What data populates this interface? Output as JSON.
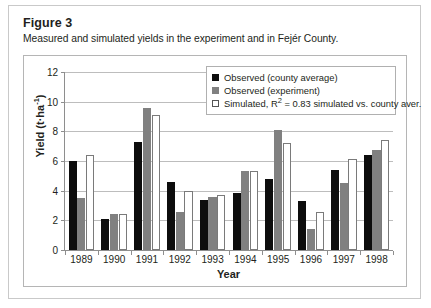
{
  "figure": {
    "label": "Figure 3",
    "caption": "Measured and simulated yields in the experiment and in Fejér County."
  },
  "legend": {
    "position": "top-right-inside",
    "items": [
      {
        "swatch": "observed-county",
        "label": "Observed (county average)",
        "color": "#0d0d0d"
      },
      {
        "swatch": "observed-exp",
        "label": "Observed (experiment)",
        "color": "#808080"
      },
      {
        "swatch": "simulated",
        "label_prefix": "Simulated, R",
        "label_sup": "2",
        "label_suffix": " = 0.83 simulated vs. county aver.",
        "color": "#ffffff"
      }
    ]
  },
  "axes": {
    "y_title": "Yield (t·ha-1)",
    "y_title_main": "Yield (t·ha",
    "y_title_sup": "-1",
    "y_title_end": ")",
    "x_title": "Year",
    "y_ticks": [
      "0",
      "2",
      "4",
      "6",
      "8",
      "10",
      "12"
    ],
    "x_ticks": [
      "1989",
      "1990",
      "1991",
      "1992",
      "1993",
      "1994",
      "1995",
      "1996",
      "1997",
      "1998"
    ]
  },
  "chart_data": {
    "type": "bar",
    "title": "Measured and simulated yields in the experiment and in Fejér County.",
    "xlabel": "Year",
    "ylabel": "Yield (t·ha⁻¹)",
    "ylim": [
      0,
      12
    ],
    "ytick_step": 2,
    "grid": true,
    "legend_position": "upper right",
    "categories": [
      "1989",
      "1990",
      "1991",
      "1992",
      "1993",
      "1994",
      "1995",
      "1996",
      "1997",
      "1998"
    ],
    "series": [
      {
        "name": "Observed (county average)",
        "color": "#0d0d0d",
        "values": [
          6.0,
          2.1,
          7.25,
          4.6,
          3.4,
          3.85,
          4.8,
          3.3,
          5.4,
          6.4
        ]
      },
      {
        "name": "Observed (experiment)",
        "color": "#808080",
        "values": [
          3.5,
          2.45,
          9.6,
          2.55,
          3.6,
          5.3,
          8.1,
          1.45,
          4.55,
          6.75
        ]
      },
      {
        "name": "Simulated, R2 = 0.83 simulated vs. county aver.",
        "color": "#ffffff",
        "values": [
          6.4,
          2.45,
          9.1,
          3.95,
          3.7,
          5.3,
          7.2,
          2.55,
          6.15,
          7.4
        ]
      }
    ],
    "annotations": [
      "R2 = 0.83 simulated vs. county aver."
    ]
  }
}
